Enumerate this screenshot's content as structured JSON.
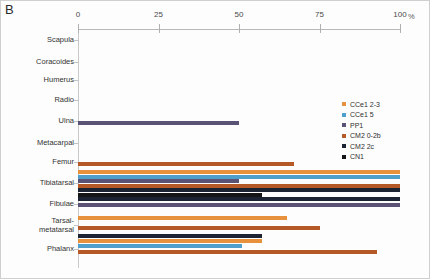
{
  "panel": {
    "label": "B"
  },
  "colors": {
    "CCe1 2-3": "#E8913C",
    "CCe1 5": "#4E9FCB",
    "PP1": "#5B5375",
    "CM2 0-2b": "#B55A27",
    "CM2 2c": "#1C2433",
    "CN1": "#151515",
    "axis": "#b9b9b9",
    "text": "#333333",
    "background": "#fdfdfd"
  },
  "chart_data": {
    "type": "bar",
    "orientation": "horizontal",
    "title": "B",
    "xlabel": "%",
    "ylabel": "",
    "xlim": [
      0,
      100
    ],
    "xticks": [
      0,
      25,
      50,
      75,
      100
    ],
    "xtick_labels": [
      "0",
      "25",
      "50",
      "75",
      "100"
    ],
    "xunit": "%",
    "grid": false,
    "legend_position": "right",
    "legend_entries": [
      "CCe1 2-3",
      "CCe1 5",
      "PP1",
      "CM2 0-2b",
      "CM2 2c",
      "CN1"
    ],
    "categories": [
      "Scapula",
      "Coracoides",
      "Humerus",
      "Radio",
      "Ulna",
      "Metacarpal",
      "Femur",
      "Tibiatarsal",
      "Fibulae",
      "Tarsal-metatarsal",
      "Phalanx"
    ],
    "series": [
      {
        "name": "CCe1 2-3",
        "values": [
          0,
          0,
          0,
          0,
          0,
          0,
          0,
          100,
          0,
          65,
          57
        ]
      },
      {
        "name": "CCe1 5",
        "values": [
          0,
          0,
          0,
          0,
          0,
          0,
          0,
          100,
          0,
          0,
          51
        ]
      },
      {
        "name": "PP1",
        "values": [
          0,
          0,
          0,
          0,
          50,
          0,
          0,
          50,
          100,
          0,
          0
        ]
      },
      {
        "name": "CM2 0-2b",
        "values": [
          0,
          0,
          0,
          0,
          0,
          0,
          67,
          100,
          0,
          0,
          0
        ]
      },
      {
        "name": "CM2 2c",
        "values": [
          0,
          0,
          0,
          0,
          0,
          0,
          0,
          100,
          0,
          0,
          0
        ]
      },
      {
        "name": "CN1",
        "values": [
          0,
          0,
          0,
          0,
          0,
          0,
          0,
          57,
          0,
          0,
          0
        ]
      }
    ],
    "bars": [
      {
        "category": "Ulna",
        "series": "PP1",
        "value": 50,
        "y": 121
      },
      {
        "category": "Femur",
        "series": "CM2 0-2b",
        "value": 67,
        "y": 162
      },
      {
        "category": "Tibiatarsal",
        "series": "CCe1 2-3",
        "value": 100,
        "y": 170
      },
      {
        "category": "Tibiatarsal",
        "series": "CCe1 5",
        "value": 100,
        "y": 175
      },
      {
        "category": "Tibiatarsal",
        "series": "PP1",
        "value": 50,
        "y": 179
      },
      {
        "category": "Tibiatarsal",
        "series": "CM2 0-2b",
        "value": 100,
        "y": 184
      },
      {
        "category": "Tibiatarsal",
        "series": "CM2 2c",
        "value": 100,
        "y": 188
      },
      {
        "category": "Tibiatarsal",
        "series": "CN1",
        "value": 57,
        "y": 193
      },
      {
        "category": "Tibiatarsal",
        "series": "CM2 2c",
        "value": 100,
        "y": 197
      },
      {
        "category": "Fibulae",
        "series": "PP1",
        "value": 100,
        "y": 203
      },
      {
        "category": "Tarsal-metatarsal",
        "series": "CCe1 2-3",
        "value": 65,
        "y": 216
      },
      {
        "category": "Tarsal-metatarsal",
        "series": "CM2 0-2b",
        "value": 75,
        "y": 226
      },
      {
        "category": "Phalanx",
        "series": "CM2 2c",
        "value": 57,
        "y": 234
      },
      {
        "category": "Phalanx",
        "series": "CCe1 2-3",
        "value": 57,
        "y": 239
      },
      {
        "category": "Phalanx",
        "series": "CCe1 5",
        "value": 51,
        "y": 244
      },
      {
        "category": "Phalanx",
        "series": "CM2 0-2b",
        "value": 93,
        "y": 250
      }
    ],
    "category_tick_y": [
      40,
      62,
      80,
      100,
      121,
      143,
      162,
      183,
      204,
      225,
      249
    ]
  }
}
